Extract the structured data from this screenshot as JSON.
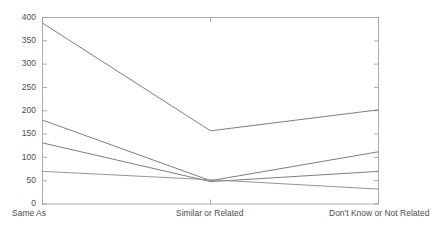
{
  "chart_data": {
    "type": "line",
    "title": "",
    "xlabel": "",
    "ylabel": "",
    "categories": [
      "Same As",
      "Similar or Related",
      "Don't Know or Not Related"
    ],
    "ylim": [
      0,
      400
    ],
    "yticks": [
      0,
      50,
      100,
      150,
      200,
      250,
      300,
      350,
      400
    ],
    "ytick_labels": [
      "0",
      "50",
      "100",
      "150",
      "200",
      "250",
      "300",
      "350",
      "400"
    ],
    "grid": false,
    "legend": "none",
    "series": [
      {
        "name": "series-1",
        "values": [
          388,
          157,
          202
        ],
        "color": "#6e6e6e"
      },
      {
        "name": "series-2",
        "values": [
          180,
          50,
          112
        ],
        "color": "#6e6e6e"
      },
      {
        "name": "series-3",
        "values": [
          131,
          48,
          70
        ],
        "color": "#6e6e6e"
      },
      {
        "name": "series-4",
        "values": [
          70,
          52,
          32
        ],
        "color": "#8a8a8a"
      }
    ],
    "axis_color": "#9a9a9a",
    "background": "#ffffff"
  },
  "axes": {
    "ytick_0": "0",
    "ytick_1": "50",
    "ytick_2": "100",
    "ytick_3": "150",
    "ytick_4": "200",
    "ytick_5": "250",
    "ytick_6": "300",
    "ytick_7": "350",
    "ytick_8": "400",
    "xtick_0": "Same As",
    "xtick_1": "Similar or Related",
    "xtick_2": "Don't Know or Not Related"
  }
}
